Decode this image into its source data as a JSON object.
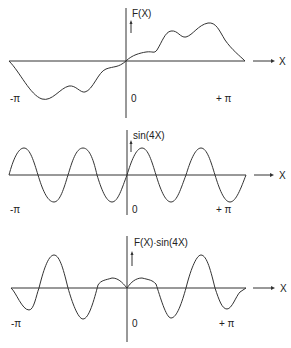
{
  "panels": [
    {
      "title": "F(X)",
      "x_label": "X",
      "x_min_label": "-π",
      "x_zero_label": "0",
      "x_max_label": "+ π"
    },
    {
      "title": "sin(4X)",
      "x_label": "X",
      "x_min_label": "-π",
      "x_zero_label": "0",
      "x_max_label": "+ π"
    },
    {
      "title": "F(X)∙sin(4X)",
      "x_label": "X",
      "x_min_label": "-π",
      "x_zero_label": "0",
      "x_max_label": "+ π"
    }
  ],
  "colors": {
    "ink": "#333333",
    "background": "#ffffff"
  }
}
